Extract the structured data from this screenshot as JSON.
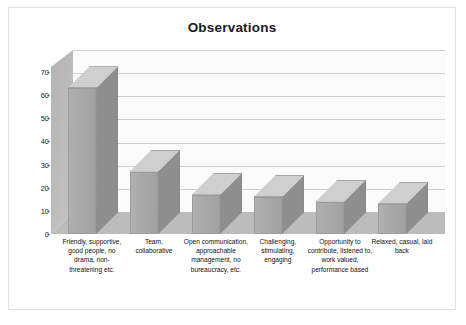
{
  "chart_data": {
    "type": "bar",
    "title": "Observations",
    "xlabel": "",
    "ylabel": "",
    "ylim": [
      0,
      70
    ],
    "yticks": [
      0,
      10,
      20,
      30,
      40,
      50,
      60,
      70
    ],
    "grid": true,
    "legend": "none",
    "three_d": true,
    "categories": [
      "Friendly, supportive, good people, no drama, non-threatening etc.",
      "Team, collaborative",
      "Open communication, approachable management, no bureaucracy, etc.",
      "Challenging, stimulating, engaging",
      "Opportunity to contribute, listened to, work valued, performance based",
      "Relaxed, casual, laid back"
    ],
    "values": [
      63,
      27,
      17,
      16,
      14,
      13
    ]
  },
  "colors": {
    "bar_face": "#a8a8a8",
    "bar_top": "#cfcfcf",
    "bar_side": "#8e8e8e",
    "floor": "#bcbcbc",
    "side_wall": "#bdbdbd",
    "back_wall": "#fbfbfb",
    "gridline": "#d0d0d0",
    "frame_border": "#e2e2e2",
    "text": "#1a1a1a"
  }
}
